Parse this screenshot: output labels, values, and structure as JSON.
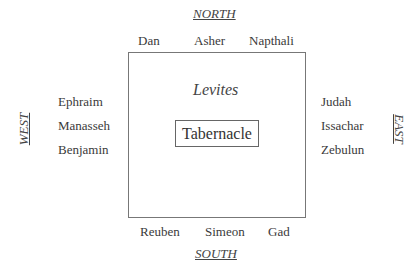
{
  "directions": {
    "north": "NORTH",
    "south": "SOUTH",
    "west": "WEST",
    "east": "EAST"
  },
  "center": {
    "levites": "Levites",
    "tabernacle": "Tabernacle"
  },
  "tribes": {
    "north": [
      "Dan",
      "Asher",
      "Napthali"
    ],
    "west": [
      "Ephraim",
      "Manasseh",
      "Benjamin"
    ],
    "east": [
      "Judah",
      "Issachar",
      "Zebulun"
    ],
    "south": [
      "Reuben",
      "Simeon",
      "Gad"
    ]
  }
}
